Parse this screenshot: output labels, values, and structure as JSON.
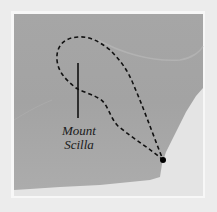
{
  "map": {
    "colors": {
      "background": "#ececec",
      "frame": "#f7f7f7",
      "land": "#a9a9a9",
      "land_dark": "#9d9d9d",
      "sea": "#e4e4e4",
      "route": "#111111",
      "marker": "#000000"
    },
    "labels": {
      "mountain_line1": "Mount",
      "mountain_line2": "Scilla"
    },
    "features": {
      "route": "dashed-route-loop",
      "endpoint": "route-endpoint-marker",
      "peak_marker": "vertical-peak-line"
    }
  }
}
